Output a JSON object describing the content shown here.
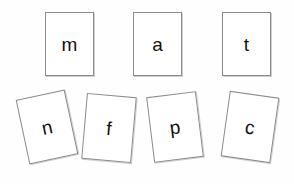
{
  "scene": {
    "background_color": "#fefefe",
    "card_face_color": "#ffffff",
    "card_border_color": "#8a8a8a",
    "card_shadow_color": "#cfcfcf",
    "letter_color": "#121212",
    "description": "Seven paper letter cards arranged on a white surface: a neat upright top row and a scattered, tilted bottom row."
  },
  "rows": {
    "top": {
      "name": "top-row",
      "cards": [
        {
          "letter": "m",
          "x": 45,
          "y": 12,
          "width": 49,
          "height": 64,
          "rotation": 0
        },
        {
          "letter": "a",
          "x": 133,
          "y": 12,
          "width": 49,
          "height": 64,
          "rotation": 0
        },
        {
          "letter": "t",
          "x": 222,
          "y": 12,
          "width": 49,
          "height": 64,
          "rotation": 0
        }
      ]
    },
    "bottom": {
      "name": "bottom-row",
      "cards": [
        {
          "letter": "n",
          "x": 22,
          "y": 94,
          "width": 50,
          "height": 66,
          "rotation": -12
        },
        {
          "letter": "f",
          "x": 84,
          "y": 95,
          "width": 50,
          "height": 66,
          "rotation": 5
        },
        {
          "letter": "p",
          "x": 150,
          "y": 94,
          "width": 50,
          "height": 66,
          "rotation": -7
        },
        {
          "letter": "c",
          "x": 225,
          "y": 94,
          "width": 50,
          "height": 66,
          "rotation": 8
        }
      ]
    }
  },
  "letters_in_order": [
    "m",
    "a",
    "t",
    "n",
    "f",
    "p",
    "c"
  ]
}
